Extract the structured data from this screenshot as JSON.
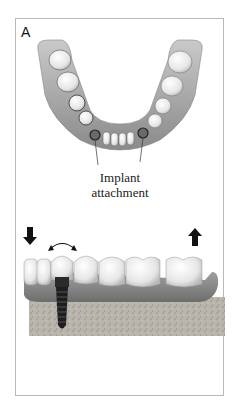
{
  "figure": {
    "panel_label": "A",
    "top_view": {
      "description": "Lower jaw (mandible) viewed from above with two implant attachments",
      "callout_line1": "Implant",
      "callout_line2": "attachment"
    },
    "side_view": {
      "description": "Side view of implant-supported overdenture on gum and bone",
      "arrows": [
        "down-arrow",
        "curved-double-arrow",
        "up-arrow"
      ]
    },
    "colors": {
      "gum": "#8f8f8f",
      "tooth": "#f2f2f2",
      "implant": "#2a2a2a",
      "bone": "#b5b0a8",
      "border": "#b8b8b8"
    }
  }
}
